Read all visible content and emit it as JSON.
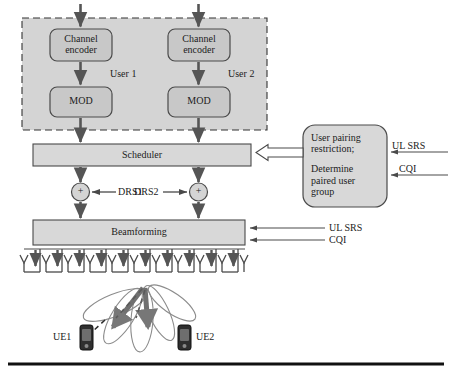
{
  "diagram": {
    "colors": {
      "user_panel_fill": "#d4d4d4",
      "block_fill": "#c8c8c8",
      "bar_fill": "#d8d8d8",
      "stroke": "#4a4a4a",
      "dark_stroke": "#2b2b2b",
      "text": "#1c1c1c",
      "arrow_dark": "#555555",
      "beam_stroke": "#8c8c8c",
      "baseline": "#111111"
    },
    "user_panel": {
      "name": "user-processing-panel",
      "border_style": "dashed",
      "users": [
        {
          "label": "User 1",
          "blocks": [
            {
              "id": "channel-encoder-1",
              "line1": "Channel",
              "line2": "encoder"
            },
            {
              "id": "mod-1",
              "line1": "MOD",
              "line2": ""
            }
          ]
        },
        {
          "label": "User 2",
          "blocks": [
            {
              "id": "channel-encoder-2",
              "line1": "Channel",
              "line2": "encoder"
            },
            {
              "id": "mod-2",
              "line1": "MOD",
              "line2": ""
            }
          ]
        }
      ]
    },
    "scheduler": {
      "name": "scheduler-bar",
      "label": "Scheduler"
    },
    "adders": [
      {
        "id": "adder-1",
        "symbol": "+",
        "input_label": "DRS1",
        "input_side": "right"
      },
      {
        "id": "adder-2",
        "symbol": "+",
        "input_label": "DRS2",
        "input_side": "left"
      }
    ],
    "beamforming": {
      "name": "beamforming-bar",
      "label": "Beamforming",
      "side_inputs": [
        {
          "label": "UL SRS"
        },
        {
          "label": "CQI"
        }
      ]
    },
    "pairing_box": {
      "name": "user-pairing-box",
      "lines": [
        "User pairing",
        "restriction;",
        "",
        "Determine",
        "paired user",
        "group"
      ],
      "side_inputs": [
        {
          "label": "UL SRS"
        },
        {
          "label": "CQI"
        }
      ]
    },
    "antenna_array": {
      "name": "antenna-array",
      "element_count": 11
    },
    "terminals": [
      {
        "id": "ue-1",
        "label": "UE1"
      },
      {
        "id": "ue-2",
        "label": "UE2"
      }
    ],
    "beams": {
      "name": "beam-lobes",
      "lobe_count": 5,
      "main_beam_count": 2
    }
  }
}
